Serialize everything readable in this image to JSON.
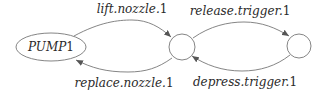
{
  "diagram": {
    "type": "state-machine",
    "nodes": [
      {
        "id": "pump",
        "label": "PUMP1",
        "shape": "ellipse"
      },
      {
        "id": "s1",
        "label": "",
        "shape": "circle"
      },
      {
        "id": "s2",
        "label": "",
        "shape": "circle"
      }
    ],
    "edges": [
      {
        "from": "pump",
        "to": "s1",
        "label": "lift.nozzle.1",
        "base": "lift.nozzle.",
        "idx": "1"
      },
      {
        "from": "s1",
        "to": "pump",
        "label": "replace.nozzle.1",
        "base": "replace.nozzle.",
        "idx": "1"
      },
      {
        "from": "s1",
        "to": "s2",
        "label": "release.trigger.1",
        "base": "release.trigger.",
        "idx": "1"
      },
      {
        "from": "s2",
        "to": "s1",
        "label": "depress.trigger.1",
        "base": "depress.trigger.",
        "idx": "1"
      }
    ],
    "pump_label": {
      "base": "PUMP",
      "idx": "1"
    }
  }
}
